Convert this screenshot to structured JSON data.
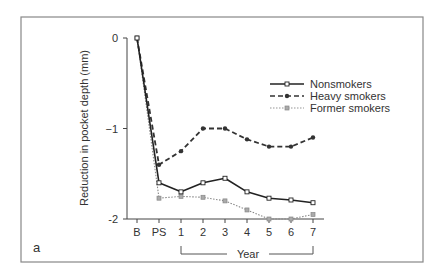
{
  "panel_label": "a",
  "chart_data": {
    "type": "line",
    "title": "",
    "xlabel": "Year",
    "ylabel": "Reduction in pocket depth (mm)",
    "categories": [
      "B",
      "PS",
      "1",
      "2",
      "3",
      "4",
      "5",
      "6",
      "7"
    ],
    "year_bracket": {
      "from": "1",
      "to": "7",
      "label": "Year"
    },
    "ylim": [
      -2,
      0
    ],
    "yticks": [
      0,
      -1,
      -2
    ],
    "ytick_labels": [
      "0",
      "−1",
      "-2"
    ],
    "grid": false,
    "legend_position": "upper right",
    "series": [
      {
        "name": "Nonsmokers",
        "style": "solid",
        "marker": "open-square",
        "color": "#222222",
        "values": [
          0,
          -1.6,
          -1.7,
          -1.6,
          -1.55,
          -1.7,
          -1.77,
          -1.79,
          -1.82
        ]
      },
      {
        "name": "Heavy smokers",
        "style": "dashed",
        "marker": "filled-diamond",
        "color": "#333333",
        "values": [
          0,
          -1.4,
          -1.25,
          -1.0,
          -1.0,
          -1.12,
          -1.2,
          -1.2,
          -1.1
        ]
      },
      {
        "name": "Former smokers",
        "style": "dotted",
        "marker": "gray-square",
        "color": "#888888",
        "values": [
          0,
          -1.77,
          -1.75,
          -1.76,
          -1.8,
          -1.9,
          -2.0,
          -2.0,
          -1.95
        ]
      }
    ]
  }
}
